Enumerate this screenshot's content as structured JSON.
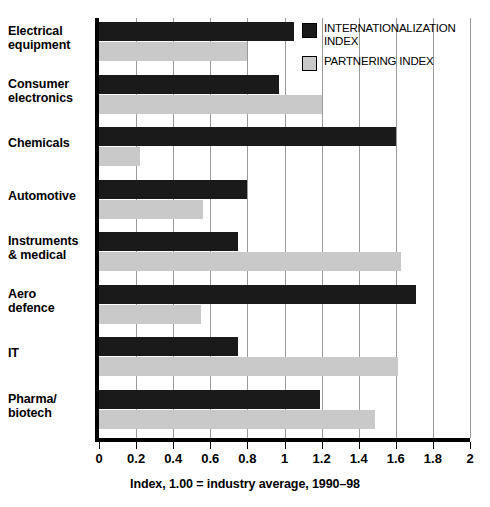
{
  "chart_data": {
    "type": "bar",
    "orientation": "horizontal",
    "title": "",
    "xlabel": "Index, 1.00 = industry average, 1990–98",
    "ylabel": "",
    "xlim": [
      0,
      2
    ],
    "xticks": [
      "0",
      "0.2",
      "0.4",
      "0.6",
      "0.8",
      "1",
      "1.2",
      "1.4",
      "1.6",
      "1.8",
      "2"
    ],
    "xtick_values": [
      0,
      0.2,
      0.4,
      0.6,
      0.8,
      1.0,
      1.2,
      1.4,
      1.6,
      1.8,
      2.0
    ],
    "grid": true,
    "grid_axis": "x",
    "legend_position": "top-right",
    "categories": [
      "Electrical\nequipment",
      "Consumer\nelectronics",
      "Chemicals",
      "Automotive",
      "Instruments\n& medical",
      "Aero\ndefence",
      "IT",
      "Pharma/\nbiotech"
    ],
    "series": [
      {
        "name": "INTERNATIONALIZATION\nINDEX",
        "color": "#1a1a1a",
        "values": [
          1.05,
          0.97,
          1.6,
          0.8,
          0.75,
          1.71,
          0.75,
          1.19
        ]
      },
      {
        "name": "PARTNERING INDEX",
        "color": "#c9c9c9",
        "values": [
          0.8,
          1.2,
          0.22,
          0.56,
          1.63,
          0.55,
          1.61,
          1.49
        ]
      }
    ]
  },
  "legend": {
    "items": [
      {
        "label": "INTERNATIONALIZATION\nINDEX",
        "swatch": "dark"
      },
      {
        "label": "PARTNERING INDEX",
        "swatch": "light"
      }
    ]
  },
  "axis": {
    "x_title": "Index, 1.00 = industry average, 1990–98"
  }
}
